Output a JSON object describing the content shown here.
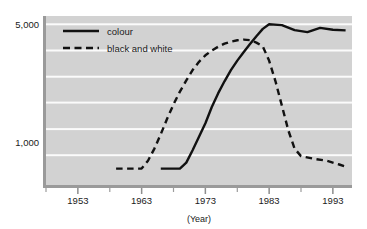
{
  "chart_data": {
    "type": "line",
    "title": "",
    "subtitle": "",
    "xlabel": "(Year)",
    "ylabel": "",
    "scale": "log",
    "grid": true,
    "legend_position": "top-left-inside",
    "xlim": [
      1948,
      1996
    ],
    "ylim": [
      560,
      5600
    ],
    "xticks": [
      "1953",
      "1963",
      "1973",
      "1983",
      "1993"
    ],
    "xtick_values": [
      1953,
      1963,
      1973,
      1983,
      1993
    ],
    "xminor_interval": 5,
    "yticks": [
      "5,000",
      "1,000"
    ],
    "ytick_values": [
      5000,
      1000
    ],
    "gridline_values": [
      5000,
      3500,
      2450,
      1720,
      1200,
      840
    ],
    "series": [
      {
        "name": "colour",
        "style": "solid",
        "color": "#111111",
        "points": [
          [
            1966,
            700
          ],
          [
            1969,
            700
          ],
          [
            1970,
            760
          ],
          [
            1971,
            900
          ],
          [
            1972,
            1080
          ],
          [
            1973,
            1300
          ],
          [
            1974,
            1620
          ],
          [
            1975,
            1950
          ],
          [
            1976,
            2300
          ],
          [
            1977,
            2680
          ],
          [
            1978,
            3050
          ],
          [
            1979,
            3420
          ],
          [
            1980,
            3820
          ],
          [
            1981,
            4250
          ],
          [
            1982,
            4700
          ],
          [
            1983,
            5000
          ],
          [
            1985,
            4950
          ],
          [
            1987,
            4620
          ],
          [
            1989,
            4500
          ],
          [
            1991,
            4760
          ],
          [
            1993,
            4640
          ],
          [
            1995,
            4600
          ]
        ]
      },
      {
        "name": "black and white",
        "style": "dashed",
        "color": "#111111",
        "points": [
          [
            1959,
            700
          ],
          [
            1963,
            700
          ],
          [
            1964,
            780
          ],
          [
            1965,
            920
          ],
          [
            1966,
            1120
          ],
          [
            1967,
            1380
          ],
          [
            1968,
            1680
          ],
          [
            1969,
            2000
          ],
          [
            1970,
            2330
          ],
          [
            1971,
            2680
          ],
          [
            1972,
            3000
          ],
          [
            1973,
            3280
          ],
          [
            1974,
            3500
          ],
          [
            1975,
            3680
          ],
          [
            1976,
            3840
          ],
          [
            1977,
            3950
          ],
          [
            1978,
            4020
          ],
          [
            1979,
            4060
          ],
          [
            1980,
            4030
          ],
          [
            1981,
            3900
          ],
          [
            1982,
            3700
          ],
          [
            1983,
            3050
          ],
          [
            1984,
            2300
          ],
          [
            1985,
            1650
          ],
          [
            1986,
            1180
          ],
          [
            1987,
            920
          ],
          [
            1988,
            830
          ],
          [
            1990,
            800
          ],
          [
            1992,
            780
          ],
          [
            1994,
            740
          ],
          [
            1995,
            720
          ]
        ]
      }
    ],
    "legend": [
      {
        "label": "colour",
        "style": "solid"
      },
      {
        "label": "black and white",
        "style": "dashed"
      }
    ]
  }
}
